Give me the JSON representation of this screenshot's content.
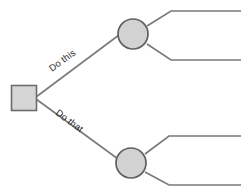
{
  "diagram": {
    "type": "decision-tree",
    "background_color": "#ffffff",
    "line_color": "#7a7a7a",
    "node_fill_color": "#d4d4d4",
    "node_stroke_color": "#646464",
    "label_color": "#2b2b2b",
    "decision_node": {
      "shape": "square",
      "label": "",
      "x": 11,
      "y": 85,
      "size": 25
    },
    "branches": [
      {
        "id": "branch-upper",
        "label": "Do this",
        "label_rotation_deg": -27,
        "from": {
          "x": 36,
          "y": 97
        },
        "to": {
          "x": 118,
          "y": 34
        }
      },
      {
        "id": "branch-lower",
        "label": "Do that",
        "label_rotation_deg": 27,
        "from": {
          "x": 36,
          "y": 99
        },
        "to": {
          "x": 117,
          "y": 160
        }
      }
    ],
    "chance_nodes": [
      {
        "id": "chance-node-upper",
        "shape": "circle",
        "label": "",
        "cx": 133,
        "cy": 34,
        "r": 15
      },
      {
        "id": "chance-node-lower",
        "shape": "circle",
        "label": "",
        "cx": 131,
        "cy": 163,
        "r": 15
      }
    ],
    "outcomes": [
      {
        "id": "outcome-1",
        "label": "",
        "parent": "chance-node-upper",
        "elbow": {
          "x": 171,
          "y": 11
        },
        "end": {
          "x": 241,
          "y": 11
        }
      },
      {
        "id": "outcome-2",
        "label": "",
        "parent": "chance-node-upper",
        "elbow": {
          "x": 171,
          "y": 60
        },
        "end": {
          "x": 241,
          "y": 60
        }
      },
      {
        "id": "outcome-3",
        "label": "",
        "parent": "chance-node-lower",
        "elbow": {
          "x": 169,
          "y": 136
        },
        "end": {
          "x": 241,
          "y": 136
        }
      },
      {
        "id": "outcome-4",
        "label": "",
        "parent": "chance-node-lower",
        "elbow": {
          "x": 169,
          "y": 185
        },
        "end": {
          "x": 241,
          "y": 185
        }
      }
    ]
  }
}
